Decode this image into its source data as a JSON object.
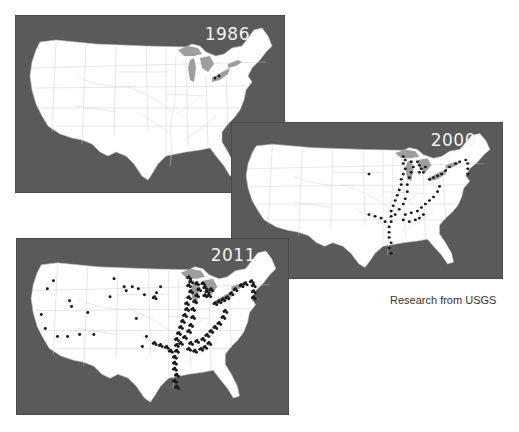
{
  "figure": {
    "panels": [
      {
        "year": "1986",
        "coverage": "Lake St. Clair / western Lake Erie only"
      },
      {
        "year": "2000",
        "coverage": "Great Lakes, Mississippi, Illinois, Ohio, Tennessee, Arkansas rivers, Hudson River"
      },
      {
        "year": "2011",
        "coverage": "Eastern river systems plus scattered western sites (California, Nevada, Colorado, Utah, Kansas, Texas)"
      }
    ],
    "colors": {
      "background": "#5a5a5a",
      "land": "#ffffff",
      "lakes": "#9e9e9e",
      "sightings": "#1a1a1a",
      "year_label": "#f2f2f2"
    }
  },
  "credit": "Research from USGS"
}
